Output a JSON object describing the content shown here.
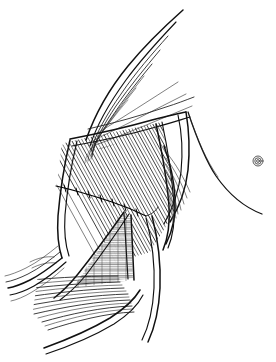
{
  "figure": {
    "style": "black ink line art on white background",
    "background_color": "#ffffff",
    "ink_color": "#111111",
    "width_px": 276,
    "height_px": 362,
    "caption": ""
  },
  "regions": [
    {
      "id": "upper-arm-shoulder",
      "name": "upper-arm-shoulder-region",
      "description": "Converging curved fiber bundles sweeping from upper right apex down to the left",
      "label": ""
    },
    {
      "id": "muscle-belly",
      "name": "hatched-muscle-belly",
      "description": "Dense parallel diagonal hatching representing muscle fiber striations",
      "label": ""
    },
    {
      "id": "exposed-tissue",
      "name": "exposed-tissue-patch",
      "description": "Finely cross-hatched triangular patch of exposed deep tissue",
      "label": ""
    },
    {
      "id": "torso-contour",
      "name": "chest-wall-contour",
      "description": "Sweeping body outline of the chest wall curving to the lower right",
      "label": ""
    },
    {
      "id": "lower-flank",
      "name": "lower-flank-fibers",
      "description": "Long sweeping fiber lines running across the lower flank",
      "label": ""
    }
  ],
  "annotations": {
    "suture_line": {
      "name": "suture-line",
      "description": "Transverse suture line with interrupted stitch ticks crossing the muscle belly",
      "stitch_count": 7,
      "label": ""
    },
    "nipple_marker": {
      "name": "nipple-areola-marker",
      "description": "Small concentric circle marking the nipple-areola complex on the chest wall",
      "ring_count": 3,
      "label": ""
    }
  },
  "legend": {
    "visible": false,
    "entries": []
  },
  "text_labels": []
}
